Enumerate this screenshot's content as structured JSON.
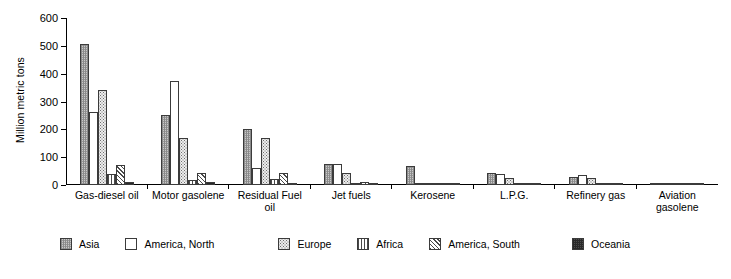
{
  "chart_data": {
    "type": "bar",
    "title": "",
    "xlabel": "",
    "ylabel": "Million metric tons",
    "ylim": [
      0,
      600
    ],
    "yticks": [
      0,
      100,
      200,
      300,
      400,
      500,
      600
    ],
    "ytick_labels": [
      "0",
      "100",
      "200",
      "300",
      "400",
      "500",
      "600"
    ],
    "grid": false,
    "legend_position": "bottom",
    "categories": [
      "Gas-diesel oil",
      "Motor gasolene",
      "Residual Fuel oil",
      "Jet fuels",
      "Kerosene",
      "L.P.G.",
      "Refinery gas",
      "Aviation gasolene"
    ],
    "series": [
      {
        "name": "Asia",
        "pattern": "cross-hatch-grey",
        "values": [
          508,
          250,
          203,
          75,
          68,
          42,
          30,
          2
        ]
      },
      {
        "name": "America, North",
        "pattern": "solid-white",
        "values": [
          262,
          375,
          62,
          74,
          3,
          40,
          35,
          4
        ]
      },
      {
        "name": "Europe",
        "pattern": "dotted-grey",
        "values": [
          341,
          170,
          168,
          42,
          9,
          25,
          25,
          1
        ]
      },
      {
        "name": "Africa",
        "pattern": "vertical-lines",
        "values": [
          38,
          17,
          22,
          8,
          3,
          4,
          4,
          1
        ]
      },
      {
        "name": "America, South",
        "pattern": "diagonal-lines",
        "values": [
          72,
          42,
          42,
          10,
          4,
          8,
          9,
          1
        ]
      },
      {
        "name": "Oceania",
        "pattern": "dark-cross-hatch",
        "values": [
          11,
          12,
          6,
          4,
          2,
          3,
          3,
          1
        ]
      }
    ]
  },
  "legend": {
    "items": [
      {
        "label": "Asia"
      },
      {
        "label": "America, North"
      },
      {
        "label": "Europe"
      },
      {
        "label": "Africa"
      },
      {
        "label": "America, South"
      },
      {
        "label": "Oceania"
      }
    ]
  }
}
